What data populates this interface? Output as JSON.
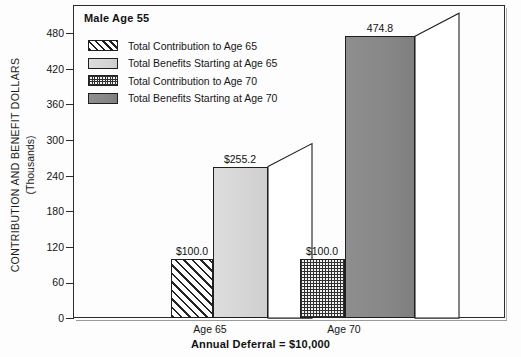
{
  "chart_data": {
    "type": "bar",
    "title": "Male Age 55",
    "subtitle": "",
    "xlabel": "Annual Deferral  =  $10,000",
    "ylabel": "CONTRIBUTION AND BENEFIT DOLLARS",
    "ylabel_units": "(Thousands)",
    "ylim": [
      0,
      480
    ],
    "ytick_values": [
      0,
      60,
      120,
      180,
      240,
      300,
      360,
      420,
      480
    ],
    "ytick_labels": [
      "0",
      "60",
      "120",
      "180",
      "240",
      "300",
      "360",
      "420",
      "480"
    ],
    "grid": false,
    "legend_position": "inside-top-left",
    "style": "3d-perspective-bars",
    "categories": [
      "Age 65",
      "Age 70"
    ],
    "series": [
      {
        "name": "Total Contribution to Age 65",
        "fill": "diagonal-hatch",
        "color": "#ffffff",
        "values": [
          100.0,
          null
        ],
        "data_labels": [
          "$100.0",
          null
        ]
      },
      {
        "name": "Total Benefits Starting at Age 65",
        "fill": "light-gray-solid",
        "color": "#d6d6d6",
        "values": [
          255.2,
          null
        ],
        "data_labels": [
          "$255.2",
          null
        ]
      },
      {
        "name": "Total Contribution to Age 70",
        "fill": "checkerboard",
        "color": "#f2f2f2",
        "values": [
          null,
          100.0
        ],
        "data_labels": [
          null,
          "$100.0"
        ]
      },
      {
        "name": "Total Benefits Starting at Age 70",
        "fill": "dark-gray-solid",
        "color": "#888888",
        "values": [
          null,
          474.8
        ],
        "data_labels": [
          null,
          "474.8"
        ]
      }
    ],
    "bars": [
      {
        "category": "Age 65",
        "series": "Total Contribution to Age 65",
        "value": 100.0,
        "label": "$100.0"
      },
      {
        "category": "Age 65",
        "series": "Total Benefits Starting at Age 65",
        "value": 255.2,
        "label": "$255.2"
      },
      {
        "category": "Age 70",
        "series": "Total Contribution to Age 70",
        "value": 100.0,
        "label": "$100.0"
      },
      {
        "category": "Age 70",
        "series": "Total Benefits Starting at Age 70",
        "value": 474.8,
        "label": "474.8"
      }
    ],
    "annotations": []
  },
  "legend": {
    "items": [
      {
        "label": "Total Contribution to Age 65"
      },
      {
        "label": "Total Benefits Starting at Age 65"
      },
      {
        "label": "Total Contribution to Age 70"
      },
      {
        "label": "Total Benefits Starting at Age 70"
      }
    ]
  },
  "axis": {
    "y_title_line1": "CONTRIBUTION AND BENEFIT DOLLARS",
    "y_title_line2": "(Thousands)",
    "y_ticks": [
      "480",
      "420",
      "360",
      "300",
      "240",
      "180",
      "120",
      "60",
      "0"
    ],
    "x_categories": [
      "Age 65",
      "Age 70"
    ],
    "x_title": "Annual Deferral  =  $10,000"
  },
  "labels": {
    "bar1": "$100.0",
    "bar2": "$255.2",
    "bar3": "$100.0",
    "bar4": "474.8"
  },
  "colors": {
    "frame": "#2d2d2d",
    "text": "#141414",
    "light_gray_bar": "#d6d6d6",
    "dark_gray_bar": "#888888",
    "background": "#fdfdfd"
  }
}
